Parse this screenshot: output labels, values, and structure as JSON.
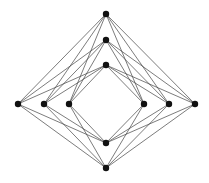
{
  "diagram": {
    "type": "graph",
    "colors": {
      "node": "#111111",
      "edge": "#444444",
      "background": "#ffffff"
    },
    "node_radius": 3.2,
    "nodes": [
      {
        "id": "a1",
        "x": 106,
        "y": 14
      },
      {
        "id": "a2",
        "x": 106,
        "y": 40
      },
      {
        "id": "a3",
        "x": 106,
        "y": 65
      },
      {
        "id": "a4",
        "x": 106,
        "y": 143
      },
      {
        "id": "a5",
        "x": 106,
        "y": 168
      },
      {
        "id": "b1",
        "x": 18,
        "y": 104
      },
      {
        "id": "b2",
        "x": 44,
        "y": 104
      },
      {
        "id": "b3",
        "x": 69,
        "y": 104
      },
      {
        "id": "b4",
        "x": 144,
        "y": 104
      },
      {
        "id": "b5",
        "x": 169,
        "y": 104
      },
      {
        "id": "b6",
        "x": 195,
        "y": 104
      }
    ],
    "partition_a": [
      "a1",
      "a2",
      "a3",
      "a4",
      "a5"
    ],
    "partition_b": [
      "b1",
      "b2",
      "b3",
      "b4",
      "b5",
      "b6"
    ]
  }
}
